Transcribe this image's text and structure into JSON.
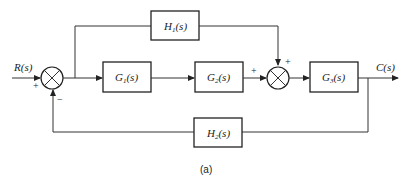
{
  "diagram": {
    "type": "control-system-block-diagram",
    "input": {
      "label": "R(s)"
    },
    "output": {
      "label": "C(s)"
    },
    "blocks": [
      {
        "id": "G1",
        "label": "G1(s)",
        "main": "G",
        "sub": "1"
      },
      {
        "id": "G2",
        "label": "G2(s)",
        "main": "G",
        "sub": "2"
      },
      {
        "id": "G3",
        "label": "G3(s)",
        "main": "G",
        "sub": "3"
      },
      {
        "id": "H1",
        "label": "H1(s)",
        "main": "H",
        "sub": "1"
      },
      {
        "id": "H2",
        "label": "H2(s)",
        "main": "H",
        "sub": "2"
      }
    ],
    "summing_junctions": [
      {
        "id": "S1",
        "signs": {
          "input": "+",
          "feedback": "−"
        }
      },
      {
        "id": "S2",
        "signs": {
          "from_G2": "+",
          "from_H1": "+"
        }
      }
    ],
    "connections": [
      "R(s) → S1 (+)",
      "S1 → G1",
      "S1 output → H1 (feedforward)",
      "G1 → G2",
      "G2 → S2 (+)",
      "H1 → S2 (+)",
      "S2 → G3",
      "G3 → C(s)",
      "C(s) → H2 → S1 (−)"
    ],
    "caption": "(a)",
    "suffix": "(s)"
  }
}
